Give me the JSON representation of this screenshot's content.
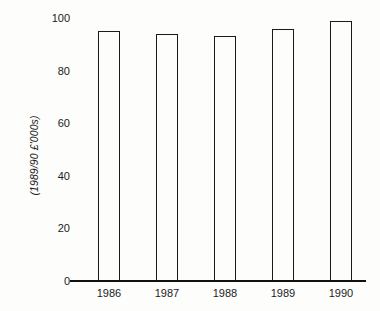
{
  "chart_data": {
    "type": "bar",
    "title": "",
    "subtitle": "",
    "xlabel": "",
    "ylabel": "(1989/90 £'000s)",
    "categories": [
      "1986",
      "1987",
      "1988",
      "1989",
      "1990"
    ],
    "values": [
      95,
      94,
      93,
      96,
      99
    ],
    "series": [
      {
        "name": "",
        "values": [
          95,
          94,
          93,
          96,
          99
        ]
      }
    ],
    "ylim": [
      0,
      100
    ],
    "y_ticks": [
      0,
      20,
      40,
      60,
      80,
      100
    ],
    "y_tick_labels": [
      "0",
      "20",
      "40",
      "60",
      "80",
      "100"
    ],
    "grid": false,
    "legend": false,
    "legend_position": "none",
    "bar_style": {
      "fill": "none",
      "edge_color": "#1a1a1a",
      "edge_width": 1.6
    },
    "axis_color": "#111111",
    "background_color": "#fdfdfb",
    "text_color": "#1b1b1b"
  }
}
